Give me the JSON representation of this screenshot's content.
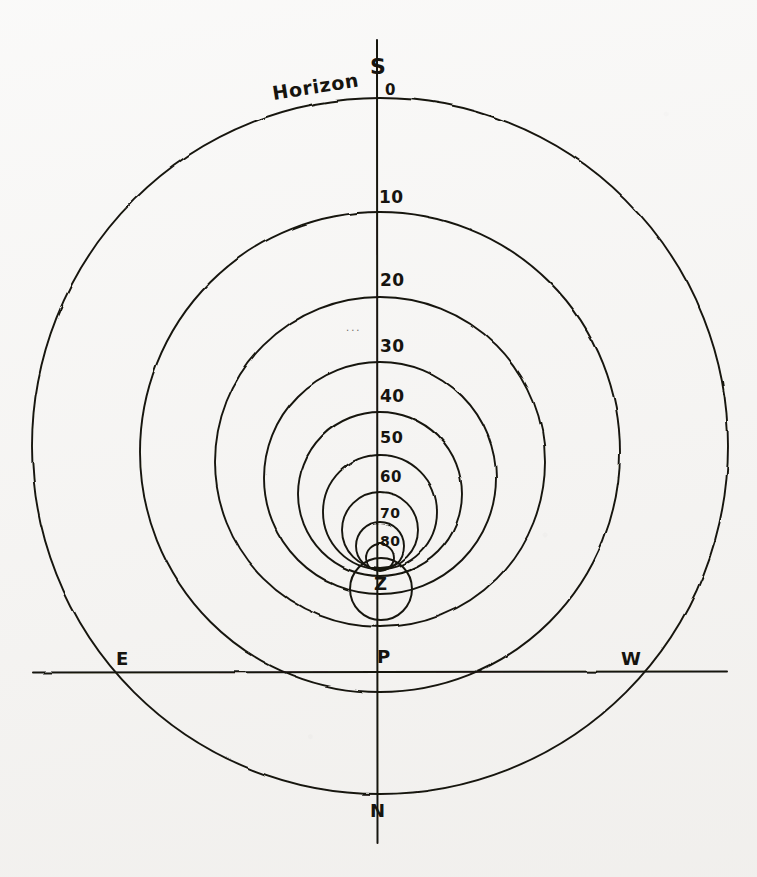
{
  "figure": {
    "background_color": "#f4f3f1",
    "ink_color": "#16140f",
    "width": 757,
    "height": 877
  },
  "labels": {
    "horizon": "Horizon",
    "south": "S",
    "north": "N",
    "east": "E",
    "west": "W",
    "zenith": "Z",
    "pole": "P",
    "smudge": "..."
  },
  "chart_data": {
    "type": "diagram",
    "subtype": "almucantar-altitude-circles",
    "axis_vertical": {
      "name": "meridian",
      "from_label": "S",
      "to_label": "N",
      "x": 377,
      "y_top": 40,
      "y_bottom": 843
    },
    "axis_horizontal": {
      "name": "east-west-line",
      "from_label": "E",
      "to_label": "W",
      "y": 672,
      "x_left": 33,
      "x_right": 727
    },
    "altitude_labels": [
      "0",
      "10",
      "20",
      "30",
      "40",
      "50",
      "60",
      "70",
      "80"
    ],
    "altitude_values": [
      0,
      10,
      20,
      30,
      40,
      50,
      60,
      70,
      80
    ],
    "zenith_label": "Z",
    "zenith_value": 90,
    "circles": [
      {
        "altitude": 0,
        "label": "0",
        "cx": 380,
        "cy": 446,
        "r": 348,
        "top_y": 98,
        "label_x": 388,
        "label_y": 82
      },
      {
        "altitude": 10,
        "label": "10",
        "cx": 380,
        "cy": 452,
        "r": 240,
        "top_y": 212,
        "label_x": 382,
        "label_y": 194
      },
      {
        "altitude": 20,
        "label": "20",
        "cx": 380,
        "cy": 462,
        "r": 165,
        "top_y": 297,
        "label_x": 382,
        "label_y": 276
      },
      {
        "altitude": 30,
        "label": "30",
        "cx": 380,
        "cy": 478,
        "r": 116,
        "top_y": 362,
        "label_x": 382,
        "label_y": 342
      },
      {
        "altitude": 40,
        "label": "40",
        "cx": 380,
        "cy": 494,
        "r": 82,
        "top_y": 412,
        "label_x": 382,
        "label_y": 392
      },
      {
        "altitude": 50,
        "label": "50",
        "cx": 380,
        "cy": 512,
        "r": 57,
        "top_y": 455,
        "label_x": 382,
        "label_y": 434
      },
      {
        "altitude": 60,
        "label": "60",
        "cx": 380,
        "cy": 530,
        "r": 38,
        "top_y": 492,
        "label_x": 382,
        "label_y": 474
      },
      {
        "altitude": 70,
        "label": "70",
        "cx": 380,
        "cy": 546,
        "r": 24,
        "top_y": 522,
        "label_x": 382,
        "label_y": 508
      },
      {
        "altitude": 80,
        "label": "80",
        "cx": 380,
        "cy": 557,
        "r": 14,
        "top_y": 543,
        "label_x": 382,
        "label_y": 538
      },
      {
        "altitude": 90,
        "label": "Z",
        "cx": 381,
        "cy": 589,
        "r": 31,
        "top_y": 558,
        "label_x": 381,
        "label_y": 583
      }
    ],
    "points": [
      {
        "name": "S",
        "label": "S",
        "x": 377,
        "y": 70,
        "note": "south point at top of meridian"
      },
      {
        "name": "N",
        "label": "N",
        "x": 377,
        "y": 812,
        "note": "north point at bottom of meridian"
      },
      {
        "name": "E",
        "label": "E",
        "x": 122,
        "y": 659,
        "note": "east point on horizontal line"
      },
      {
        "name": "W",
        "label": "W",
        "x": 628,
        "y": 659,
        "note": "west point on horizontal line"
      },
      {
        "name": "P",
        "label": "P",
        "x": 377,
        "y": 659,
        "note": "pole, where circles converge at the horizontal line"
      },
      {
        "name": "Z",
        "label": "Z",
        "x": 381,
        "y": 589,
        "note": "zenith, innermost circle"
      }
    ],
    "legend_position": "none",
    "grid": false
  }
}
